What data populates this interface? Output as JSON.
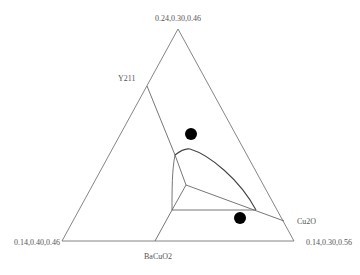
{
  "diagram": {
    "type": "ternary-phase-diagram",
    "vertices": {
      "top": {
        "label": "0.24,0.30,0.46",
        "x": 178,
        "y": 29
      },
      "left": {
        "label": "0.14,0.40,0.46",
        "x": 62,
        "y": 241
      },
      "right": {
        "label": "0.14,0.30,0.56",
        "x": 294,
        "y": 241
      }
    },
    "phase_labels": [
      {
        "id": "y211",
        "label": "Y211",
        "x": 118,
        "y": 81
      },
      {
        "id": "cu2o",
        "label": "Cu2O",
        "x": 297,
        "y": 224
      },
      {
        "id": "bacuo2",
        "label": "BaCuO2",
        "x": 144,
        "y": 259
      }
    ],
    "points": [
      {
        "id": "dot-1",
        "x": 191,
        "y": 134,
        "r": 6
      },
      {
        "id": "dot-2",
        "x": 240,
        "y": 218,
        "r": 6
      }
    ],
    "colors": {
      "edge": "#777777",
      "curve": "#444444",
      "dot": "#000000",
      "text": "#555555"
    }
  }
}
